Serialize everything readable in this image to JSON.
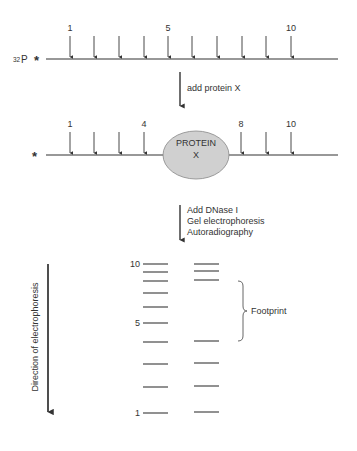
{
  "diagram": {
    "stage1": {
      "label_prefix": "32",
      "label_element": "P",
      "marker": "*",
      "site_numbers": [
        {
          "site": 1,
          "label": "1"
        },
        {
          "site": 5,
          "label": "5"
        },
        {
          "site": 10,
          "label": "10"
        }
      ],
      "site_count": 10
    },
    "step1": {
      "label": "add protein X"
    },
    "stage2": {
      "marker": "*",
      "site_numbers": [
        {
          "site": 1,
          "label": "1"
        },
        {
          "site": 4,
          "label": "4"
        },
        {
          "site": 8,
          "label": "8"
        },
        {
          "site": 10,
          "label": "10"
        }
      ],
      "protected_sites": [
        5,
        6,
        7
      ],
      "protein_label": "PROTEIN",
      "protein_site_label": "X",
      "protein_color": "#d0d0d0"
    },
    "step2": {
      "lines": [
        "Add DNase I",
        "Gel electrophoresis",
        "Autoradiography"
      ]
    },
    "gel": {
      "direction_label": "Direction of electrophoresis",
      "band_labels": [
        {
          "band": 10,
          "label": "10"
        },
        {
          "band": 5,
          "label": "5"
        },
        {
          "band": 1,
          "label": "1"
        }
      ],
      "lanes": [
        {
          "name": "without protein",
          "bands": [
            1,
            2,
            3,
            4,
            5,
            6,
            7,
            8,
            9,
            10
          ]
        },
        {
          "name": "with protein",
          "bands": [
            1,
            2,
            3,
            4,
            8,
            9,
            10
          ]
        }
      ],
      "footprint_label": "Footprint"
    }
  }
}
